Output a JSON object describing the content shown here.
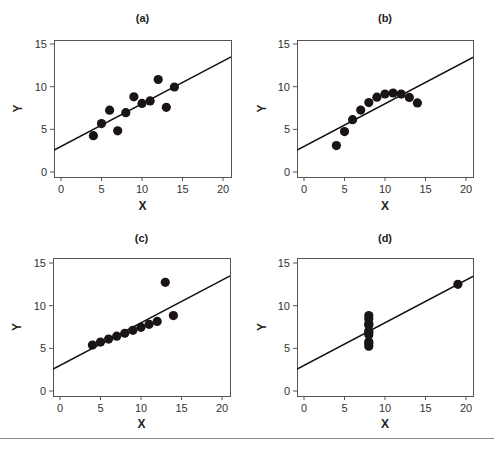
{
  "figure": {
    "rule_color": "#888888",
    "point_color": "#1a1416",
    "line_color": "#111111"
  },
  "chart_data": [
    {
      "type": "scatter",
      "title": "(a)",
      "xlabel": "X",
      "ylabel": "Y",
      "xlim": [
        -0.8,
        20.8
      ],
      "ylim": [
        -0.5,
        15.5
      ],
      "xticks": [
        0,
        5,
        10,
        15,
        20
      ],
      "yticks": [
        0,
        5,
        10,
        15
      ],
      "grid": false,
      "x": [
        4,
        5,
        6,
        7,
        8,
        9,
        10,
        11,
        12,
        13,
        14
      ],
      "y": [
        4.26,
        5.68,
        7.24,
        4.82,
        6.95,
        8.81,
        8.04,
        8.33,
        10.84,
        7.58,
        9.96
      ],
      "fit_line": {
        "intercept": 3.0,
        "slope": 0.5
      }
    },
    {
      "type": "scatter",
      "title": "(b)",
      "xlabel": "X",
      "ylabel": "Y",
      "xlim": [
        -0.8,
        20.8
      ],
      "ylim": [
        -0.5,
        15.5
      ],
      "xticks": [
        0,
        5,
        10,
        15,
        20
      ],
      "yticks": [
        0,
        5,
        10,
        15
      ],
      "grid": false,
      "x": [
        4,
        5,
        6,
        7,
        8,
        9,
        10,
        11,
        12,
        13,
        14
      ],
      "y": [
        3.1,
        4.74,
        6.13,
        7.26,
        8.14,
        8.77,
        9.14,
        9.26,
        9.13,
        8.74,
        8.1
      ],
      "fit_line": {
        "intercept": 3.0,
        "slope": 0.5
      }
    },
    {
      "type": "scatter",
      "title": "(c)",
      "xlabel": "X",
      "ylabel": "Y",
      "xlim": [
        -0.8,
        20.8
      ],
      "ylim": [
        -0.5,
        15.5
      ],
      "xticks": [
        0,
        5,
        10,
        15,
        20
      ],
      "yticks": [
        0,
        5,
        10,
        15
      ],
      "grid": false,
      "x": [
        4,
        5,
        6,
        7,
        8,
        9,
        10,
        11,
        12,
        13,
        14
      ],
      "y": [
        5.39,
        5.73,
        6.08,
        6.42,
        6.77,
        7.11,
        7.46,
        7.81,
        8.15,
        12.74,
        8.84
      ],
      "fit_line": {
        "intercept": 3.0,
        "slope": 0.5
      }
    },
    {
      "type": "scatter",
      "title": "(d)",
      "xlabel": "X",
      "ylabel": "Y",
      "xlim": [
        -0.8,
        20.8
      ],
      "ylim": [
        -0.5,
        15.5
      ],
      "xticks": [
        0,
        5,
        10,
        15,
        20
      ],
      "yticks": [
        0,
        5,
        10,
        15
      ],
      "grid": false,
      "x": [
        8,
        8,
        8,
        8,
        8,
        8,
        8,
        8,
        8,
        8,
        19
      ],
      "y": [
        5.25,
        5.56,
        5.76,
        6.58,
        6.89,
        7.04,
        7.71,
        7.91,
        8.47,
        8.84,
        12.5
      ],
      "fit_line": {
        "intercept": 3.0,
        "slope": 0.5
      }
    }
  ]
}
